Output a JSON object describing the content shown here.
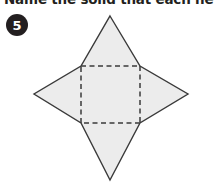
{
  "page": {
    "background_color": "#ffffff",
    "instruction": "Name the solid that each net for",
    "instruction_full_visible": "Name the solid that each net for"
  },
  "question": {
    "number": "5",
    "badge_shape": "filled-circle",
    "badge_color": "#231f20",
    "badge_text_color": "#ffffff"
  },
  "figure": {
    "name": "square-pyramid-net",
    "fill_color": "#ececec",
    "stroke_color": "#3a3a3a",
    "dash_color": "#3a3a3a",
    "outline_points": "110,16 140,66 188,94 140,123 110,180 81,123 34,94 81,66",
    "square": {
      "top_left": "81,66",
      "top_right": "140,66",
      "bottom_right": "140,123",
      "bottom_left": "81,123",
      "edge_style": "dashed"
    },
    "triangles": [
      {
        "name": "top-triangle",
        "apex": "110,16",
        "base": "81,66 140,66"
      },
      {
        "name": "right-triangle",
        "apex": "188,94",
        "base": "140,66 140,123"
      },
      {
        "name": "bottom-triangle",
        "apex": "110,180",
        "base": "81,123 140,123"
      },
      {
        "name": "left-triangle",
        "apex": "34,94",
        "base": "81,66 81,123"
      }
    ]
  }
}
